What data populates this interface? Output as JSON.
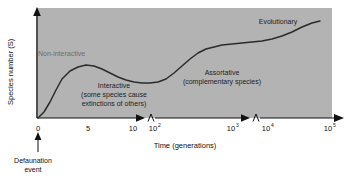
{
  "chart_data": {
    "type": "line",
    "title": "",
    "xlabel": "Time (generations)",
    "ylabel": "Species number (S)",
    "x_tick_labels": [
      "0",
      "5",
      "10",
      "10",
      "10",
      "10",
      "10"
    ],
    "x_tick_exponents": [
      "",
      "",
      "",
      "2",
      "3",
      "4",
      "5"
    ],
    "x_tick_positions_px": [
      38,
      88,
      133,
      155,
      233,
      268,
      330
    ],
    "axis_breaks_px": [
      144,
      250
    ],
    "grid": false,
    "legend": "none",
    "curve_description": "Species number rises sharply from zero after defaunation, peaks in the interactive phase near 5 generations, dips to a trough around 10-100 generations, rises through the assortative phase to a plateau near 10^3-10^4 generations, then climbs again in the evolutionary phase toward 10^5 generations.",
    "curve_points_px": [
      [
        38,
        118
      ],
      [
        44,
        112
      ],
      [
        50,
        102
      ],
      [
        56,
        90
      ],
      [
        62,
        79
      ],
      [
        70,
        71
      ],
      [
        78,
        67
      ],
      [
        86,
        65
      ],
      [
        94,
        66
      ],
      [
        102,
        69
      ],
      [
        110,
        73
      ],
      [
        118,
        77
      ],
      [
        126,
        80
      ],
      [
        134,
        82
      ],
      [
        142,
        83
      ],
      [
        150,
        83
      ],
      [
        158,
        82
      ],
      [
        166,
        79
      ],
      [
        174,
        73
      ],
      [
        182,
        66
      ],
      [
        190,
        59
      ],
      [
        198,
        53
      ],
      [
        206,
        49
      ],
      [
        214,
        47
      ],
      [
        222,
        45
      ],
      [
        232,
        44
      ],
      [
        242,
        43
      ],
      [
        252,
        42
      ],
      [
        262,
        41
      ],
      [
        272,
        39
      ],
      [
        282,
        36
      ],
      [
        292,
        32
      ],
      [
        302,
        27
      ],
      [
        312,
        23
      ],
      [
        320,
        21
      ]
    ],
    "annotations": [
      {
        "name": "non-interactive",
        "text": "Non-interactive",
        "x_px": 38,
        "y_px": 54,
        "style": "faint"
      },
      {
        "name": "interactive",
        "text": "Interactive",
        "x_px": 114,
        "y_px": 86,
        "style": "normal"
      },
      {
        "name": "interactive-sub-1",
        "text": "(some species cause",
        "x_px": 114,
        "y_px": 95,
        "style": "normal"
      },
      {
        "name": "interactive-sub-2",
        "text": "extinctions of others)",
        "x_px": 114,
        "y_px": 104,
        "style": "normal"
      },
      {
        "name": "assortative",
        "text": "Assortative",
        "x_px": 222,
        "y_px": 73,
        "style": "normal"
      },
      {
        "name": "assortative-sub",
        "text": "(complementary species)",
        "x_px": 222,
        "y_px": 82,
        "style": "normal"
      },
      {
        "name": "evolutionary",
        "text": "Evolutionary",
        "x_px": 278,
        "y_px": 22,
        "style": "normal"
      }
    ],
    "event_marker": {
      "label_line_1": "Defaunation",
      "label_line_2": "event",
      "x_px": 38,
      "arrow_from_y_px": 150,
      "arrow_to_y_px": 128
    },
    "colors": {
      "panel_background": "#b3b3b3",
      "curve": "#2b2b2b",
      "axis": "#111111",
      "text": "#111111",
      "faint_text": "#6e6e6e",
      "page_background": "#ffffff"
    },
    "panel_px": {
      "left": 36,
      "top": 8,
      "right": 332,
      "bottom": 118
    }
  }
}
